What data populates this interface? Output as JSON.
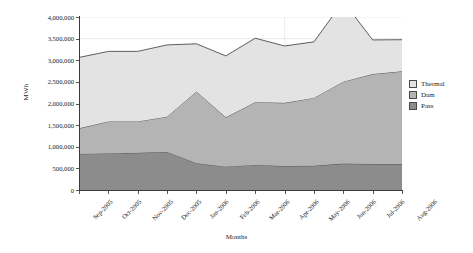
{
  "chart_data": {
    "type": "area",
    "title": "",
    "stacked": true,
    "xlabel": "Months",
    "ylabel": "MWh",
    "ylim": [
      0,
      4000000
    ],
    "ytick_step": 500000,
    "ytick_labels": [
      "4,000,000",
      "3,500,000",
      "3,000,000",
      "2,500,000",
      "2,000,000",
      "1,500,000",
      "1,000,000",
      "500,000",
      "0"
    ],
    "grid": true,
    "legend_position": "right",
    "categories": [
      "Sep-2005",
      "Oct-2005",
      "Nov-2005",
      "Dec-2005",
      "Jan-2006",
      "Feb-2006",
      "Mar-2006",
      "Apr-2006",
      "May-2006",
      "Jun-2006",
      "Jul-2006",
      "Aug-2006"
    ],
    "series": [
      {
        "name": "Pass",
        "color": "#8c8c8c",
        "values": [
          835000,
          845000,
          860000,
          880000,
          620000,
          540000,
          580000,
          555000,
          560000,
          610000,
          600000,
          600000
        ]
      },
      {
        "name": "Dam",
        "color": "#b4b4b4",
        "values": [
          590000,
          740000,
          725000,
          815000,
          1660000,
          1140000,
          1450000,
          1460000,
          1570000,
          1895000,
          2080000,
          2145000
        ]
      },
      {
        "name": "Thermal",
        "color": "#e3e3e3",
        "values": [
          1640000,
          1620000,
          1620000,
          1660000,
          1100000,
          1420000,
          1480000,
          1315000,
          1295000,
          1855000,
          790000,
          730000
        ]
      }
    ],
    "totals": [
      3065000,
      3205000,
      3205000,
      3355000,
      3380000,
      3100000,
      3510000,
      3330000,
      3425000,
      3360000,
      3470000,
      3475000
    ],
    "cumulative_pass_plus_dam": [
      1425000,
      1585000,
      1585000,
      1695000,
      2280000,
      1680000,
      2030000,
      2015000,
      2130000,
      2505000,
      2680000,
      2745000
    ]
  },
  "legend": {
    "items": [
      {
        "label": "Thermal",
        "color": "#e3e3e3"
      },
      {
        "label": "Dam",
        "color": "#b4b4b4"
      },
      {
        "label": "Pass",
        "color": "#8c8c8c"
      }
    ]
  },
  "axes": {
    "y_title": "MWh",
    "x_title": "Months"
  }
}
